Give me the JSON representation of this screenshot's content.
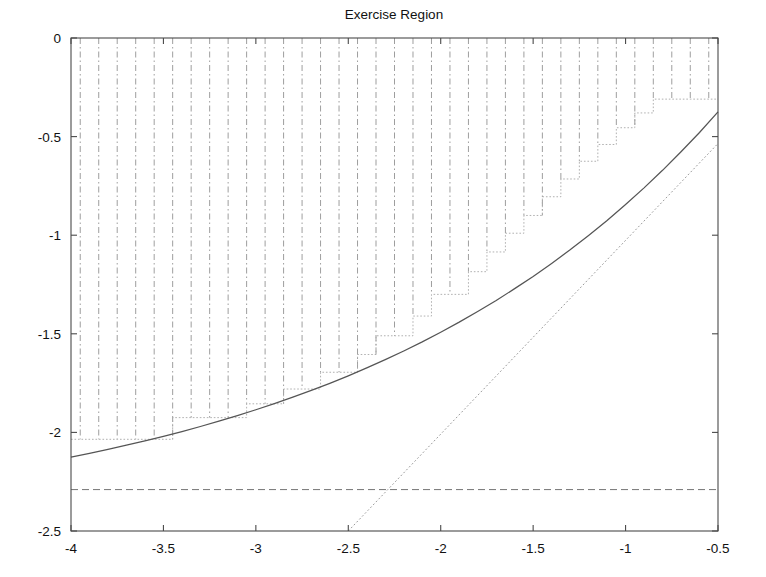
{
  "chart_data": {
    "type": "line",
    "title": "Exercise Region",
    "xlabel": "",
    "ylabel": "",
    "xlim": [
      -4,
      -0.5
    ],
    "ylim": [
      -2.5,
      0
    ],
    "grid": false,
    "legend": null,
    "legend_position": "none",
    "xticks": [
      -4,
      -3.5,
      -3,
      -2.5,
      -2,
      -1.5,
      -1,
      -0.5
    ],
    "xticklabels": [
      "-4",
      "-3.5",
      "-3",
      "-2.5",
      "-2",
      "-1.5",
      "-1",
      "-0.5"
    ],
    "yticks": [
      -2.5,
      -2,
      -1.5,
      -1,
      -0.5,
      0
    ],
    "yticklabels": [
      "-2.5",
      "-2",
      "-1.5",
      "-1",
      "-0.5",
      "0"
    ],
    "series": [
      {
        "name": "continuation-boundary",
        "style": "solid",
        "color": "#555555",
        "x": [
          -4.0,
          -3.9,
          -3.8,
          -3.7,
          -3.6,
          -3.5,
          -3.4,
          -3.3,
          -3.2,
          -3.1,
          -3.0,
          -2.9,
          -2.8,
          -2.7,
          -2.6,
          -2.5,
          -2.4,
          -2.3,
          -2.2,
          -2.1,
          -2.0,
          -1.9,
          -1.8,
          -1.7,
          -1.6,
          -1.5,
          -1.4,
          -1.3,
          -1.2,
          -1.1,
          -1.0,
          -0.9,
          -0.8,
          -0.7,
          -0.6,
          -0.5
        ],
        "y": [
          -2.125,
          -2.106,
          -2.086,
          -2.065,
          -2.043,
          -2.02,
          -1.996,
          -1.97,
          -1.943,
          -1.915,
          -1.885,
          -1.854,
          -1.821,
          -1.787,
          -1.751,
          -1.713,
          -1.673,
          -1.631,
          -1.587,
          -1.541,
          -1.492,
          -1.441,
          -1.387,
          -1.331,
          -1.271,
          -1.209,
          -1.143,
          -1.074,
          -1.001,
          -0.925,
          -0.844,
          -0.76,
          -0.671,
          -0.577,
          -0.479,
          -0.375
        ]
      },
      {
        "name": "discrete-exercise-staircase",
        "style": "dotted",
        "color": "#a8a8a8",
        "x": [
          -4.0,
          -3.9,
          -3.8,
          -3.7,
          -3.6,
          -3.5,
          -3.4,
          -3.3,
          -3.2,
          -3.1,
          -3.0,
          -2.9,
          -2.8,
          -2.7,
          -2.6,
          -2.5,
          -2.4,
          -2.3,
          -2.2,
          -2.1,
          -2.0,
          -1.9,
          -1.8,
          -1.7,
          -1.6,
          -1.5,
          -1.4,
          -1.3,
          -1.2,
          -1.1,
          -1.0,
          -0.9,
          -0.8,
          -0.7,
          -0.6,
          -0.5
        ],
        "y": [
          -2.035,
          -2.035,
          -2.035,
          -2.035,
          -2.035,
          -2.035,
          -1.925,
          -1.925,
          -1.925,
          -1.925,
          -1.855,
          -1.855,
          -1.78,
          -1.78,
          -1.695,
          -1.695,
          -1.605,
          -1.51,
          -1.51,
          -1.41,
          -1.3,
          -1.3,
          -1.185,
          -1.085,
          -0.99,
          -0.9,
          -0.805,
          -0.715,
          -0.625,
          -0.54,
          -0.455,
          -0.38,
          -0.31,
          -0.31,
          -0.31,
          -0.31
        ]
      },
      {
        "name": "payoff-line",
        "style": "dotted",
        "color": "#9a9a9a",
        "x": [
          -2.5,
          -0.5
        ],
        "y": [
          -2.5,
          -0.535
        ]
      },
      {
        "name": "perpetual-asymptote",
        "style": "dashed",
        "color": "#6f6f6f",
        "x": [
          -4.0,
          -0.5
        ],
        "y": [
          -2.29,
          -2.29
        ]
      }
    ],
    "hatching": {
      "name": "exercise-region-hatch",
      "style": "dash-dot vertical lines",
      "color": "#8c8c8c",
      "count": 35,
      "from_y": 0,
      "description": "vertical dash-dot lines filling region above the staircase boundary"
    }
  },
  "figure": {
    "title": "Exercise Region"
  }
}
